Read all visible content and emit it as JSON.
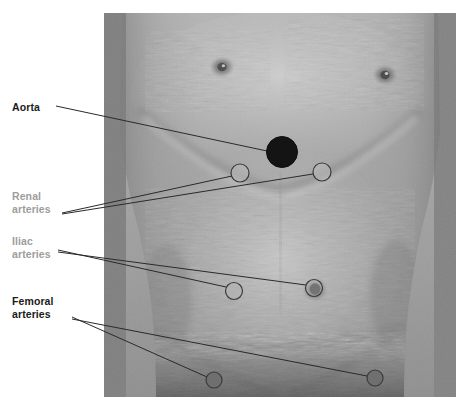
{
  "figure": {
    "kind": "anatomical-photo-overlay",
    "canvas": {
      "width": 472,
      "height": 412,
      "background": "#ffffff"
    },
    "photo": {
      "x": 104,
      "y": 13,
      "width": 352,
      "height": 384,
      "tone": "grayscale"
    }
  },
  "colors": {
    "label_dark": "#1b1b1b",
    "label_muted": "#9d9d9d",
    "leader_line": "#2a2a2a",
    "marker_stroke": "#3a3a3a",
    "marker_fill_open": "#b9b9b9",
    "marker_fill_solid": "#141414",
    "marker_fill_mid": "#6f6f6f",
    "page_background": "#ffffff"
  },
  "labels": [
    {
      "id": "aorta",
      "text": "Aorta",
      "lines": [
        "Aorta"
      ],
      "style": "dark",
      "x": 12,
      "y": 101
    },
    {
      "id": "renal",
      "text": "Renal arteries",
      "lines": [
        "Renal",
        "arteries"
      ],
      "style": "muted",
      "x": 12,
      "y": 190
    },
    {
      "id": "iliac",
      "text": "Iliac arteries",
      "lines": [
        "Iliac",
        "arteries"
      ],
      "style": "muted",
      "x": 12,
      "y": 235
    },
    {
      "id": "femoral",
      "text": "Femoral arteries",
      "lines": [
        "Femoral",
        "arteries"
      ],
      "style": "dark",
      "x": 12,
      "y": 295
    }
  ],
  "markers": [
    {
      "id": "aorta-marker",
      "label": "Aorta",
      "cx": 282,
      "cy": 152,
      "r": 15.5,
      "fill": "solid",
      "stroke": "#141414"
    },
    {
      "id": "renal-left-marker",
      "label": "Renal artery",
      "cx": 240,
      "cy": 173,
      "r": 9.0,
      "fill": "open",
      "stroke": "#3a3a3a"
    },
    {
      "id": "renal-right-marker",
      "label": "Renal artery",
      "cx": 322,
      "cy": 172,
      "r": 9.0,
      "fill": "open",
      "stroke": "#3a3a3a"
    },
    {
      "id": "iliac-left-marker",
      "label": "Iliac artery",
      "cx": 234,
      "cy": 291,
      "r": 8.5,
      "fill": "open",
      "stroke": "#3a3a3a"
    },
    {
      "id": "iliac-right-marker",
      "label": "Iliac artery",
      "cx": 314,
      "cy": 288,
      "r": 8.5,
      "fill": "open",
      "stroke": "#3a3a3a"
    },
    {
      "id": "femoral-left-marker",
      "label": "Femoral artery",
      "cx": 214,
      "cy": 380,
      "r": 8.0,
      "fill": "mid",
      "stroke": "#3a3a3a"
    },
    {
      "id": "femoral-right-marker",
      "label": "Femoral artery",
      "cx": 375,
      "cy": 378,
      "r": 8.0,
      "fill": "mid",
      "stroke": "#3a3a3a"
    }
  ],
  "leaders": [
    {
      "id": "leader-aorta",
      "from_label": "aorta",
      "x1": 56,
      "y1": 106,
      "x2": 267,
      "y2": 151
    },
    {
      "id": "leader-renal-left",
      "from_label": "renal",
      "x1": 62,
      "y1": 213,
      "x2": 232,
      "y2": 176
    },
    {
      "id": "leader-renal-right",
      "from_label": "renal",
      "x1": 62,
      "y1": 214,
      "x2": 313,
      "y2": 174
    },
    {
      "id": "leader-iliac-left",
      "from_label": "iliac",
      "x1": 58,
      "y1": 250,
      "x2": 226,
      "y2": 287
    },
    {
      "id": "leader-iliac-right",
      "from_label": "iliac",
      "x1": 58,
      "y1": 252,
      "x2": 306,
      "y2": 285
    },
    {
      "id": "leader-femoral-left",
      "from_label": "femoral",
      "x1": 72,
      "y1": 317,
      "x2": 207,
      "y2": 377
    },
    {
      "id": "leader-femoral-right",
      "from_label": "femoral",
      "x1": 72,
      "y1": 319,
      "x2": 367,
      "y2": 376
    }
  ]
}
